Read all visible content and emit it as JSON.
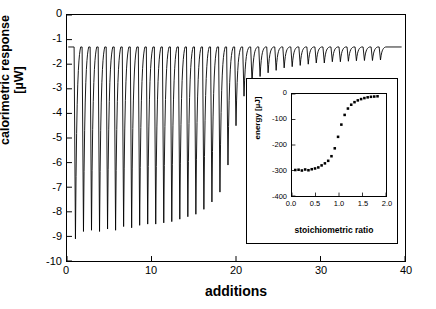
{
  "chart_data": [
    {
      "id": "main",
      "type": "line",
      "title": "",
      "xlabel": "additions",
      "ylabel": "calorimetric response [µW]",
      "xlim": [
        0,
        40
      ],
      "ylim": [
        -10,
        0
      ],
      "xticks": [
        0,
        10,
        20,
        30,
        40
      ],
      "yticks": [
        0,
        -1,
        -2,
        -3,
        -4,
        -5,
        -6,
        -7,
        -8,
        -9,
        -10
      ],
      "grid": false,
      "legend": "none",
      "baseline": -1.3,
      "description": "Isothermal titration calorimetry raw thermogram: series of downward injection peaks that shrink in amplitude with successive additions.",
      "peaks": [
        {
          "x": 1.0,
          "depth": -9.1
        },
        {
          "x": 1.95,
          "depth": -8.8
        },
        {
          "x": 2.9,
          "depth": -8.75
        },
        {
          "x": 3.85,
          "depth": -8.8
        },
        {
          "x": 4.8,
          "depth": -8.7
        },
        {
          "x": 5.75,
          "depth": -8.75
        },
        {
          "x": 6.7,
          "depth": -8.6
        },
        {
          "x": 7.65,
          "depth": -8.65
        },
        {
          "x": 8.6,
          "depth": -8.55
        },
        {
          "x": 9.55,
          "depth": -8.5
        },
        {
          "x": 10.5,
          "depth": -8.5
        },
        {
          "x": 11.45,
          "depth": -8.45
        },
        {
          "x": 12.4,
          "depth": -8.4
        },
        {
          "x": 13.35,
          "depth": -8.3
        },
        {
          "x": 14.3,
          "depth": -8.2
        },
        {
          "x": 15.25,
          "depth": -8.1
        },
        {
          "x": 16.2,
          "depth": -7.9
        },
        {
          "x": 17.15,
          "depth": -7.6
        },
        {
          "x": 18.1,
          "depth": -7.2
        },
        {
          "x": 19.05,
          "depth": -6.1
        },
        {
          "x": 20.0,
          "depth": -4.5
        },
        {
          "x": 20.95,
          "depth": -3.3
        },
        {
          "x": 21.9,
          "depth": -2.75
        },
        {
          "x": 22.85,
          "depth": -2.5
        },
        {
          "x": 23.8,
          "depth": -2.35
        },
        {
          "x": 24.75,
          "depth": -2.25
        },
        {
          "x": 25.7,
          "depth": -2.15
        },
        {
          "x": 26.65,
          "depth": -2.1
        },
        {
          "x": 27.6,
          "depth": -2.05
        },
        {
          "x": 28.55,
          "depth": -2.0
        },
        {
          "x": 29.5,
          "depth": -1.95
        },
        {
          "x": 30.45,
          "depth": -1.95
        },
        {
          "x": 31.4,
          "depth": -1.9
        },
        {
          "x": 32.35,
          "depth": -1.9
        },
        {
          "x": 33.3,
          "depth": -1.88
        },
        {
          "x": 34.25,
          "depth": -1.86
        },
        {
          "x": 35.2,
          "depth": -1.85
        },
        {
          "x": 36.15,
          "depth": -1.85
        },
        {
          "x": 37.1,
          "depth": -1.83
        }
      ]
    },
    {
      "id": "inset",
      "type": "scatter",
      "title": "",
      "xlabel": "stoichiometric ratio",
      "ylabel": "energy [µJ]",
      "xlim": [
        0.0,
        2.0
      ],
      "ylim": [
        -400,
        0
      ],
      "xticks": [
        "0.0",
        "0.5",
        "1.0",
        "1.5",
        "2.0"
      ],
      "yticks": [
        0,
        -100,
        -200,
        -300,
        -400
      ],
      "grid": false,
      "legend": "none",
      "marker": "filled-square",
      "description": "Integrated binding isotherm, sigmoidal transition near a stoichiometric ratio of 1.",
      "points": [
        {
          "x": 0.07,
          "y": -298
        },
        {
          "x": 0.14,
          "y": -297
        },
        {
          "x": 0.21,
          "y": -300
        },
        {
          "x": 0.28,
          "y": -296
        },
        {
          "x": 0.35,
          "y": -299
        },
        {
          "x": 0.42,
          "y": -295
        },
        {
          "x": 0.49,
          "y": -292
        },
        {
          "x": 0.56,
          "y": -288
        },
        {
          "x": 0.63,
          "y": -280
        },
        {
          "x": 0.7,
          "y": -272
        },
        {
          "x": 0.77,
          "y": -262
        },
        {
          "x": 0.84,
          "y": -244
        },
        {
          "x": 0.91,
          "y": -213
        },
        {
          "x": 0.98,
          "y": -168
        },
        {
          "x": 1.05,
          "y": -120
        },
        {
          "x": 1.12,
          "y": -82
        },
        {
          "x": 1.19,
          "y": -57
        },
        {
          "x": 1.26,
          "y": -42
        },
        {
          "x": 1.33,
          "y": -32
        },
        {
          "x": 1.4,
          "y": -25
        },
        {
          "x": 1.47,
          "y": -20
        },
        {
          "x": 1.54,
          "y": -16
        },
        {
          "x": 1.61,
          "y": -13
        },
        {
          "x": 1.68,
          "y": -11
        },
        {
          "x": 1.75,
          "y": -10
        },
        {
          "x": 1.82,
          "y": -9
        }
      ]
    }
  ],
  "main": {
    "xlabel": "additions",
    "ylabel": "calorimetric response [µW]",
    "yticks": [
      "0",
      "-1",
      "-2",
      "-3",
      "-4",
      "-5",
      "-6",
      "-7",
      "-8",
      "-9",
      "-10"
    ],
    "xticks": [
      "0",
      "10",
      "20",
      "30",
      "40"
    ]
  },
  "inset": {
    "xlabel": "stoichiometric ratio",
    "ylabel": "energy [µJ]",
    "yticks": [
      "0",
      "-100",
      "-200",
      "-300",
      "-400"
    ],
    "xticks": [
      "0.0",
      "0.5",
      "1.0",
      "1.5",
      "2.0"
    ]
  },
  "colors": {
    "line": "#000000",
    "axis": "#000000",
    "background": "#ffffff",
    "marker": "#000000"
  }
}
